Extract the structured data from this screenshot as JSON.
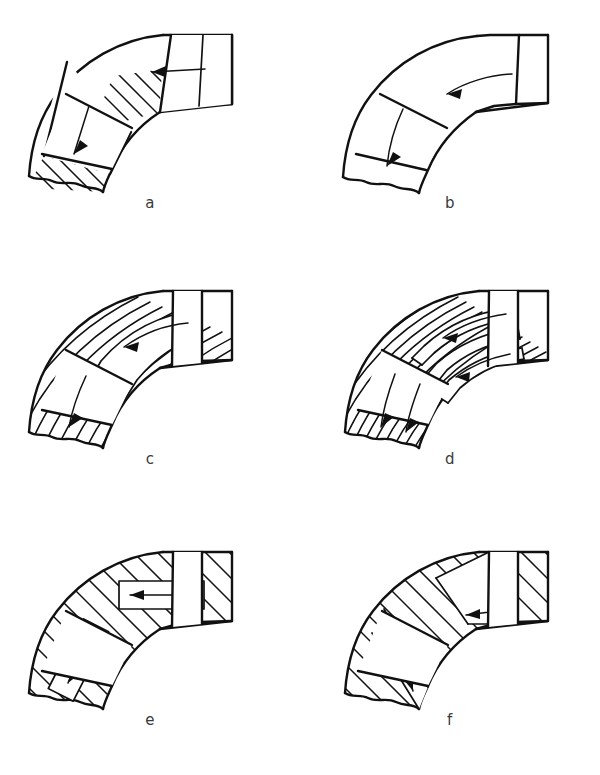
{
  "figure": {
    "title": "",
    "panel_count": 6,
    "columns": 2,
    "rows": 3,
    "background_color": "#ffffff",
    "line_color": "#111111",
    "label_color": "#3a3a3a"
  },
  "panels": [
    {
      "id": "a",
      "label": "a",
      "description": "Curved pipe bend section with two plain rectangular transverse channels, hatched body",
      "hatching": "diagonal-45",
      "channel_count": 2,
      "channel_style": "straight-rectangular-transverse",
      "arrows": [
        {
          "name": "upper-flow-arrow",
          "direction": "left"
        },
        {
          "name": "lower-flow-arrow",
          "direction": "down"
        }
      ],
      "end_cut": "double-line-vertical",
      "break_line": "wavy"
    },
    {
      "id": "b",
      "label": "b",
      "description": "Curved pipe bend section, unhatched hollow body with single transverse band",
      "hatching": "none",
      "channel_count": 1,
      "channel_style": "transverse-band",
      "arrows": [
        {
          "name": "upper-flow-arrow",
          "direction": "left-curved"
        },
        {
          "name": "lower-flow-arrow",
          "direction": "down-curved"
        }
      ],
      "end_cut": "double-line-vertical",
      "break_line": "wavy"
    },
    {
      "id": "c",
      "label": "c",
      "description": "Curved pipe bend with a single wide curved internal channel following the bend radius",
      "hatching": "diagonal-curved",
      "channel_count": 1,
      "channel_style": "curved-following-bend",
      "arrows": [
        {
          "name": "upper-flow-arrow",
          "direction": "left-curved"
        },
        {
          "name": "lower-flow-arrow",
          "direction": "down-curved"
        }
      ],
      "end_cut": "double-line-vertical",
      "break_line": "wavy"
    },
    {
      "id": "d",
      "label": "d",
      "description": "Curved pipe bend with multiple narrow curved internal channels following the bend radius",
      "hatching": "diagonal-curved-dense",
      "channel_count": 3,
      "channel_style": "multiple-curved-channels",
      "arrows": [
        {
          "name": "upper-flow-arrow-1",
          "direction": "left-curved"
        },
        {
          "name": "upper-flow-arrow-2",
          "direction": "left-curved"
        },
        {
          "name": "lower-flow-arrow-1",
          "direction": "down-curved"
        },
        {
          "name": "lower-flow-arrow-2",
          "direction": "down-curved"
        }
      ],
      "end_cut": "double-line-vertical",
      "break_line": "wavy"
    },
    {
      "id": "e",
      "label": "e",
      "description": "Curved pipe bend with straight rectangular internal channels set inside the hatched body",
      "hatching": "diagonal-45",
      "channel_count": 2,
      "channel_style": "straight-rectangular-inset",
      "arrows": [
        {
          "name": "upper-flow-arrow",
          "direction": "left"
        },
        {
          "name": "lower-flow-arrow",
          "direction": "down"
        }
      ],
      "end_cut": "double-line-vertical",
      "break_line": "wavy"
    },
    {
      "id": "f",
      "label": "f",
      "description": "Curved pipe bend with tapered wedge shaped internal channels narrowing to a point",
      "hatching": "diagonal-45",
      "channel_count": 2,
      "channel_style": "tapered-wedge",
      "arrows": [
        {
          "name": "upper-flow-arrow",
          "direction": "left"
        },
        {
          "name": "lower-flow-arrow",
          "direction": "down"
        }
      ],
      "end_cut": "double-line-vertical",
      "break_line": "wavy"
    }
  ]
}
